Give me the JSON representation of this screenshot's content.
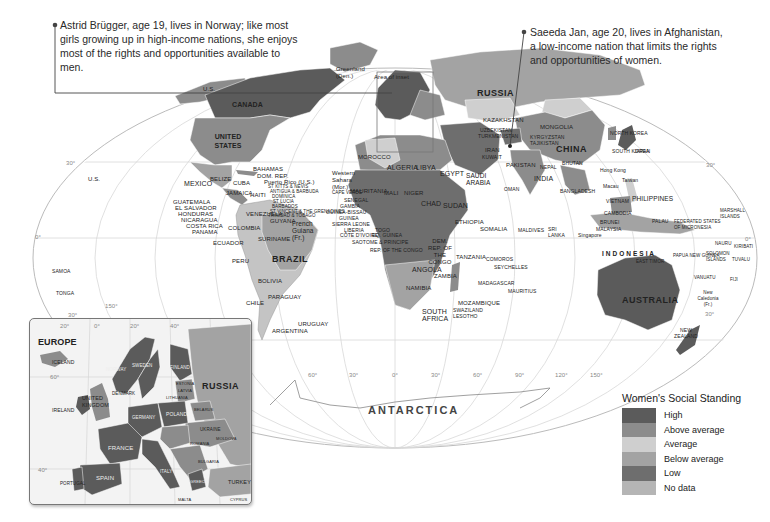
{
  "callouts": {
    "left": {
      "text": "Astrid Brügger, age 19, lives in Norway; like most girls growing up in high-income nations, she enjoys most of the rights and opportunities available to men."
    },
    "right": {
      "text": "Saeeda Jan, age 20, lives in Afghanistan, a low-income nation that limits the rights and opportunities of women."
    }
  },
  "legend": {
    "title": "Women's Social Standing",
    "items": [
      {
        "label": "High",
        "color": "#5b5b5b"
      },
      {
        "label": "Above average",
        "color": "#8c8c8c"
      },
      {
        "label": "Average",
        "color": "#cfcfcf"
      },
      {
        "label": "Below average",
        "color": "#a3a3a3"
      },
      {
        "label": "Low",
        "color": "#6e6e6e"
      },
      {
        "label": "No data",
        "color": "#b5b5b5"
      }
    ]
  },
  "map": {
    "ocean_labels": {
      "antarctica": "ANTARCTICA",
      "area_of_inset": "Area of inset"
    },
    "countries": {
      "us_alaska": "U.S.",
      "canada": "CANADA",
      "united_states": "UNITED STATES",
      "greenland": "Greenland (Den.)",
      "mexico": "MEXICO",
      "us_hawaii": "U.S.",
      "belize": "BELIZE",
      "cuba": "CUBA",
      "bahamas": "BAHAMAS",
      "dom_rep": "DOM. REP.",
      "puerto_rico": "Puerto Rico (U.S.)",
      "st_kitts": "ST KITTS & NEVIS",
      "antigua": "ANTIGUA & BARBUDA",
      "dominica": "DOMINICA",
      "st_lucia": "ST LUCIA",
      "barbados": "BARBADOS",
      "st_vincent": "ST VINCENT & THE GRENADINES",
      "trinidad": "TRINIDAD & TOBAGO",
      "jamaica": "JAMAICA",
      "haiti": "HAITI",
      "guatemala": "GUATEMALA",
      "el_salvador": "EL SALVADOR",
      "honduras": "HONDURAS",
      "nicaragua": "NICARAGUA",
      "costa_rica": "COSTA RICA",
      "panama": "PANAMA",
      "venezuela": "VENEZUELA",
      "guyana": "GUYANA",
      "colombia": "COLOMBIA",
      "suriname": "SURINAME",
      "french_guiana": "French Guiana (Fr.)",
      "ecuador": "ECUADOR",
      "peru": "PERU",
      "brazil": "BRAZIL",
      "bolivia": "BOLIVIA",
      "paraguay": "PARAGUAY",
      "chile": "CHILE",
      "argentina": "ARGENTINA",
      "uruguay": "URUGUAY",
      "samoa": "SAMOA",
      "tonga": "TONGA",
      "morocco": "MOROCCO",
      "western_sahara": "Western Sahara (Mor.)",
      "algeria": "ALGERIA",
      "libya": "LIBYA",
      "egypt": "EGYPT",
      "mauritania": "MAURITANIA",
      "mali": "MALI",
      "niger": "NIGER",
      "chad": "CHAD",
      "sudan": "SUDAN",
      "cape_verde": "CAPE VERDE",
      "senegal": "SENEGAL",
      "gambia": "GAMBIA",
      "guinea_bissau": "GUINEA-BISSAU",
      "guinea": "GUINEA",
      "sierra_leone": "SIERRA LEONE",
      "liberia": "LIBERIA",
      "cote_divoire": "CÔTE D'IVOIRE",
      "togo": "TOGO",
      "eq_guinea": "EQ. GUINEA",
      "sao_tome": "SAOTOME & PRINCIPE",
      "rep_congo": "REP. OF THE CONGO",
      "nigeria": "NIGERIA",
      "ghana": "GHANA",
      "car": "CENT. AFR. REP.",
      "ethiopia": "ETHIOPIA",
      "somalia": "SOMALIA",
      "eritrea": "ERITREA",
      "djibouti": "DJIBOUTI",
      "yemen": "YEMEN",
      "dem_rep_congo": "DEM. REP. OF THE CONGO",
      "rwanda": "RWANDA",
      "burundi": "BURUNDI",
      "uganda": "UGANDA",
      "kenya": "KENYA",
      "tanzania": "TANZANIA",
      "angola": "ANGOLA",
      "zambia": "ZAMBIA",
      "malawi": "MALAWI",
      "namibia": "NAMIBIA",
      "botswana": "BOTSWANA",
      "zimbabwe": "ZIMBABWE",
      "mozambique": "MOZAMBIQUE",
      "south_africa": "SOUTH AFRICA",
      "swaziland": "SWAZILAND",
      "lesotho": "LESOTHO",
      "madagascar": "MADAGASCAR",
      "comoros": "COMOROS",
      "seychelles": "SEYCHELLES",
      "mauritius": "MAURITIUS",
      "saudi_arabia": "SAUDI ARABIA",
      "iraq": "IRAQ",
      "iran": "IRAN",
      "kuwait": "KUWAIT",
      "bahrain": "BAHRAIN",
      "qatar": "QATAR",
      "oman": "OMAN",
      "jordan": "JORDAN",
      "russia": "RUSSIA",
      "kazakhstan": "KAZAKHSTAN",
      "uzbekistan": "UZBEKISTAN",
      "turkmenistan": "TURKMENISTAN",
      "kyrgyzstan": "KYRGYZSTAN",
      "tajikistan": "TAJIKISTAN",
      "afghanistan": "AFGHANISTAN",
      "pakistan": "PAKISTAN",
      "india": "INDIA",
      "nepal": "NEPAL",
      "bhutan": "BHUTAN",
      "bangladesh": "BANGLADESH",
      "sri_lanka": "SRI LANKA",
      "maldives": "MALDIVES",
      "mongolia": "MONGOLIA",
      "china": "CHINA",
      "north_korea": "NORTH KOREA",
      "south_korea": "SOUTH KOREA",
      "japan": "JAPAN",
      "taiwan": "Taiwan",
      "hong_kong": "Hong Kong",
      "macau": "Macau",
      "myanmar": "MYANMAR",
      "thailand": "THAILAND",
      "laos": "LAOS",
      "vietnam": "VIETNAM",
      "cambodia": "CAMBODIA",
      "philippines": "PHILIPPINES",
      "malaysia": "MALAYSIA",
      "brunei": "BRUNEI",
      "singapore": "Singapore",
      "indonesia": "I N D O N E S I A",
      "east_timor": "EAST TIMOR",
      "papua_new_guinea": "PAPUA NEW GUINEA",
      "palau": "PALAU",
      "micronesia": "FEDERATED STATES OF MICRONESIA",
      "marshall_islands": "MARSHALL ISLANDS",
      "nauru": "NAURU",
      "kiribati": "KIRIBATI",
      "solomon_islands": "SOLOMON ISLANDS",
      "tuvalu": "TUVALU",
      "vanuatu": "VANUATU",
      "fiji": "FIJI",
      "new_caledonia": "New Caledonia (Fr.)",
      "australia": "AUSTRALIA",
      "new_zealand": "NEW ZEALAND",
      "georgia": "GEORGIA",
      "azerbaijan": "AZERBAIJAN",
      "armenia": "ARMENIA"
    },
    "graticule": {
      "lat_30n": "30°",
      "lat_0": "0°",
      "lat_30s": "30°",
      "lon_150w": "150°",
      "lon_120w": "120°",
      "lon_90w": "90°",
      "lon_60w": "60°",
      "lon_30w": "30°",
      "lon_0": "0°",
      "lon_30e": "30°",
      "lon_60e": "60°",
      "lon_90e": "90°",
      "lon_120e": "120°",
      "lon_150e": "150°"
    }
  },
  "inset": {
    "title": "EUROPE",
    "graticule": {
      "lon_20w": "20°",
      "lon_0": "0°",
      "lon_20e": "20°",
      "lon_40e": "40°",
      "lat_60": "60°",
      "lat_40": "40°"
    },
    "countries": {
      "iceland": "ICELAND",
      "ireland": "IRELAND",
      "uk": "UNITED KINGDOM",
      "norway": "NORWAY",
      "sweden": "SWEDEN",
      "finland": "FINLAND",
      "denmark": "DENMARK",
      "estonia": "ESTONIA",
      "latvia": "LATVIA",
      "lithuania": "LITHUANIA",
      "russia": "RUSSIA",
      "belarus": "BELARUS",
      "poland": "POLAND",
      "germany": "GERMANY",
      "netherlands": "NETH.",
      "belgium": "BEL.",
      "lux": "LUX.",
      "czech": "CZECH REP.",
      "slovakia": "SLOVAKIA",
      "ukraine": "UKRAINE",
      "moldova": "MOLDOVA",
      "france": "FRANCE",
      "switzerland": "SWITZ.",
      "austria": "AUS.",
      "hungary": "HUNG.",
      "romania": "ROMANIA",
      "serbia": "SERBIA",
      "bulgaria": "BULGARIA",
      "italy": "ITALY",
      "greece": "GREECE",
      "spain": "SPAIN",
      "portugal": "PORTUGAL",
      "turkey": "TURKEY",
      "malta": "MALTA",
      "cyprus": "CYPRUS"
    }
  }
}
